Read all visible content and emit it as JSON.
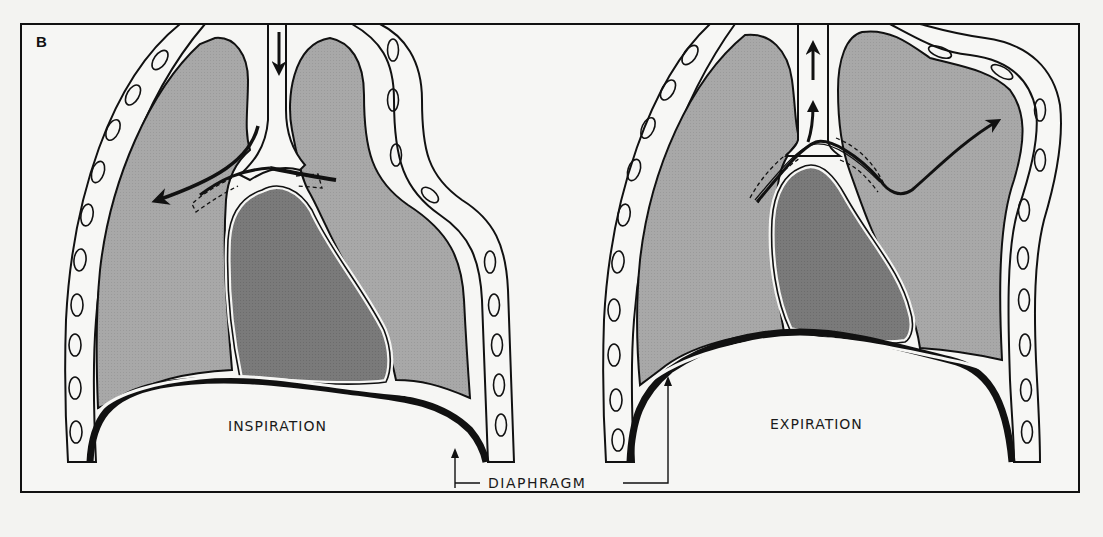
{
  "figure": {
    "panel_label": "B",
    "diagrams": [
      {
        "id": "inspiration",
        "label": "INSPIRATION",
        "airflow": "inward (arrow down trachea, into left lung)"
      },
      {
        "id": "expiration",
        "label": "EXPIRATION",
        "airflow": "outward (arrows up trachea, from right lung)"
      }
    ],
    "shared_label": "DIAPHRAGM",
    "colors": {
      "background": "#f3f3f1",
      "lung_fill": "#a9a9a9",
      "heart_fill": "#787878",
      "outline": "#111111",
      "rib_fill": "#f7f7f5"
    }
  }
}
